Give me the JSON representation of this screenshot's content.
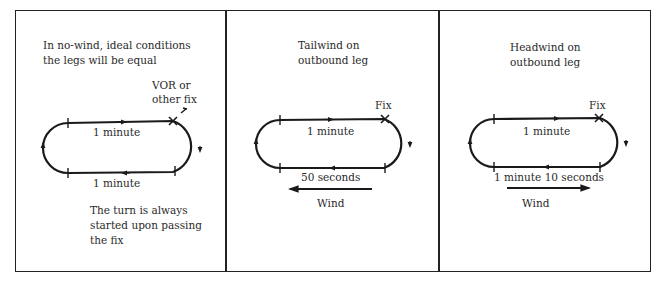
{
  "panels": [
    {
      "id": "no-wind",
      "caption_lines": [
        "In no-wind, ideal conditions",
        "the legs will be equal"
      ],
      "fix_label_lines": [
        "VOR or",
        "other fix"
      ],
      "outbound_label": "1 minute",
      "inbound_label": "1 minute",
      "note_lines": [
        "The turn is always",
        "started upon passing",
        "the fix"
      ]
    },
    {
      "id": "tailwind",
      "caption_lines": [
        "Tailwind on",
        "outbound leg"
      ],
      "fix_label": "Fix",
      "outbound_label": "1 minute",
      "inbound_label": "50 seconds",
      "wind_label": "Wind",
      "wind_direction": "left"
    },
    {
      "id": "headwind",
      "caption_lines": [
        "Headwind on",
        "outbound leg"
      ],
      "fix_label": "Fix",
      "outbound_label": "1 minute",
      "inbound_label": "1 minute 10 seconds",
      "wind_label": "Wind",
      "wind_direction": "right"
    }
  ],
  "colors": {
    "ink": "#1a1a1a",
    "background": "#ffffff"
  }
}
